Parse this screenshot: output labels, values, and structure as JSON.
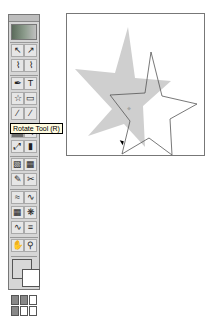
{
  "toolbox": {
    "rows": [
      [
        "selection-tool",
        "direct-selection-tool"
      ],
      [
        "lasso-tool",
        "direct-lasso-tool"
      ],
      [
        "pen-tool",
        "type-tool"
      ],
      [
        "star-tool",
        "rectangle-tool"
      ],
      [
        "paintbrush-tool",
        "pencil-tool"
      ],
      [
        "rotate-tool",
        "reflect-tool"
      ],
      [
        "scale-tool",
        "chart-tool"
      ],
      [
        "gradient-tool",
        "mesh-tool"
      ],
      [
        "eyedropper-tool",
        "scissors-tool"
      ],
      [
        "warp-tool",
        "twirl-tool"
      ],
      [
        "symbol-tool",
        "column-graph-tool"
      ],
      [
        "blend-tool",
        "slice-tool"
      ],
      [
        "hand-tool",
        "zoom-tool"
      ]
    ],
    "glyphs": [
      "↖",
      "↗",
      "⌇",
      "⌇",
      "✒",
      "T",
      "☆",
      "▭",
      "∕",
      "∕",
      "↻",
      "⇋",
      "⤢",
      "▮",
      "▧",
      "▦",
      "✎",
      "✂",
      "≈",
      "∿",
      "▦",
      "❋",
      "∿",
      "≡",
      "✋",
      "⚲"
    ],
    "selected": "rotate-tool"
  },
  "tooltip": {
    "text": "Rotate Tool (R)"
  },
  "colors": {
    "fill": "#d8d8d8",
    "stroke": "#ffffff",
    "shape_fill": "#cfcfcf",
    "outline": "#555555"
  }
}
